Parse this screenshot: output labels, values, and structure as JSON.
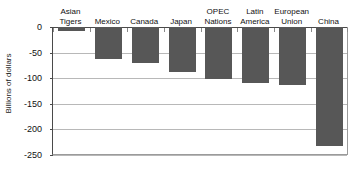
{
  "chart_data": {
    "type": "bar",
    "title": "",
    "subtitle": "",
    "xlabel": "",
    "ylabel": "Billions of dollars",
    "ylim": [
      -250,
      0
    ],
    "yticks": [
      0,
      -50,
      -100,
      -150,
      -200,
      -250
    ],
    "ytick_labels": [
      "0",
      "-50",
      "-100",
      "-150",
      "-200",
      "-250"
    ],
    "grid": true,
    "legend": false,
    "legend_position": "none",
    "orientation": "vertical",
    "bar_color": "#575757",
    "categories": [
      "Asian\nTigers",
      "Mexico",
      "Canada",
      "Japan",
      "OPEC\nNations",
      "Latin\nAmerica",
      "European\nUnion",
      "China"
    ],
    "values": [
      -8,
      -63,
      -71,
      -87,
      -102,
      -109,
      -113,
      -232
    ],
    "series": [
      {
        "name": "Trade balance",
        "values": [
          -8,
          -63,
          -71,
          -87,
          -102,
          -109,
          -113,
          -232
        ]
      }
    ]
  },
  "axes": {
    "y_axis_title": "Billions of dollars"
  },
  "colors": {
    "bar": "#575757",
    "gridline": "#b8b8b8",
    "axis": "#4a4a4a",
    "background": "#ffffff",
    "text": "#111111"
  }
}
